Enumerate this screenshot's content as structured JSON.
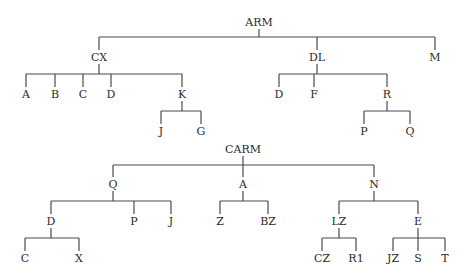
{
  "diagram": {
    "type": "tree",
    "trees": [
      {
        "label": "ARM",
        "children": [
          {
            "label": "CX",
            "children": [
              {
                "label": "A"
              },
              {
                "label": "B"
              },
              {
                "label": "C"
              },
              {
                "label": "D"
              },
              {
                "label": "K",
                "children": [
                  {
                    "label": "J"
                  },
                  {
                    "label": "G"
                  }
                ]
              }
            ]
          },
          {
            "label": "DL",
            "children": [
              {
                "label": "D"
              },
              {
                "label": "F"
              },
              {
                "label": "R",
                "children": [
                  {
                    "label": "P"
                  },
                  {
                    "label": "Q"
                  }
                ]
              }
            ]
          },
          {
            "label": "M"
          }
        ]
      },
      {
        "label": "CARM",
        "children": [
          {
            "label": "Q",
            "children": [
              {
                "label": "D",
                "children": [
                  {
                    "label": "C"
                  },
                  {
                    "label": "X"
                  }
                ]
              },
              {
                "label": "P"
              },
              {
                "label": "J"
              }
            ]
          },
          {
            "label": "A",
            "children": [
              {
                "label": "Z"
              },
              {
                "label": "BZ"
              }
            ]
          },
          {
            "label": "N",
            "children": [
              {
                "label": "LZ",
                "children": [
                  {
                    "label": "CZ"
                  },
                  {
                    "label": "R1"
                  }
                ]
              },
              {
                "label": "E",
                "children": [
                  {
                    "label": "JZ"
                  },
                  {
                    "label": "S"
                  },
                  {
                    "label": "T"
                  }
                ]
              }
            ]
          }
        ]
      }
    ]
  },
  "labels": {
    "arm": "ARM",
    "cx": "CX",
    "dl": "DL",
    "m": "M",
    "cx_a": "A",
    "cx_b": "B",
    "cx_c": "C",
    "cx_d": "D",
    "cx_k": "K",
    "k_j": "J",
    "k_g": "G",
    "dl_d": "D",
    "dl_f": "F",
    "dl_r": "R",
    "r_p": "P",
    "r_q": "Q",
    "carm": "CARM",
    "q": "Q",
    "a": "A",
    "n": "N",
    "q_d": "D",
    "q_p": "P",
    "q_j": "J",
    "d_c": "C",
    "d_x": "X",
    "a_z": "Z",
    "a_bz": "BZ",
    "n_lz": "LZ",
    "n_e": "E",
    "lz_cz": "CZ",
    "lz_r1": "R1",
    "e_jz": "JZ",
    "e_s": "S",
    "e_t": "T"
  },
  "colors": {
    "line": "#4a4a4a",
    "text": "#2a2a2a",
    "background": "#ffffff"
  }
}
